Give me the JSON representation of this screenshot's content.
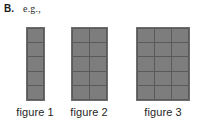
{
  "header": {
    "part_label": "B.",
    "prompt_text": "e.g.,"
  },
  "colors": {
    "background": "#ffffff",
    "cell_fill": "#7d7d7d",
    "gridline": "#5a5a5a",
    "border": "#6d6d6d",
    "text": "#262626"
  },
  "figures": [
    {
      "label": "figure 1",
      "columns": 1,
      "rows": 5,
      "square_count": 5
    },
    {
      "label": "figure 2",
      "columns": 2,
      "rows": 5,
      "square_count": 10
    },
    {
      "label": "figure 3",
      "columns": 3,
      "rows": 5,
      "square_count": 15
    }
  ]
}
